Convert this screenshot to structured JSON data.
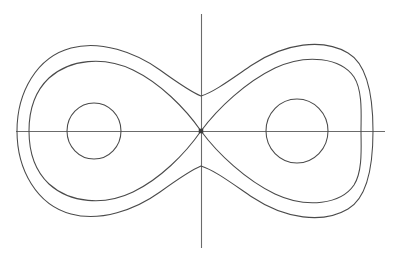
{
  "figure": {
    "title": "",
    "caption": "",
    "background_color": "#ffffff",
    "width": 399,
    "height": 259
  },
  "axes": {
    "stroke_color": "#6b6b6b",
    "x_axis": {
      "name": "horizontal-axis",
      "label": "",
      "y_pixel": 131,
      "x_start": 16,
      "x_end": 385
    },
    "y_axis": {
      "name": "vertical-axis",
      "label": "",
      "x_pixel": 201,
      "y_start": 14,
      "y_end": 248
    },
    "origin": {
      "x": 201,
      "y": 131
    }
  },
  "chart_data": {
    "type": "line",
    "title": "",
    "subtitle": "",
    "xlabel": "",
    "ylabel": "",
    "grid": false,
    "legend": "none",
    "xlim": [
      16,
      385
    ],
    "ylim": [
      14,
      248
    ],
    "fixed_points": [
      {
        "name": "saddle-origin",
        "type": "saddle",
        "x": 201,
        "y": 131
      },
      {
        "name": "center-left",
        "type": "center",
        "x": 94,
        "y": 131
      },
      {
        "name": "center-right",
        "type": "center",
        "x": 297,
        "y": 131
      }
    ],
    "series": [
      {
        "name": "small-orbit-left",
        "curve_type": "closed-circle",
        "center": [
          94,
          131
        ],
        "radius_x": 27,
        "radius_y": 28,
        "stroke": "#4a4a4a"
      },
      {
        "name": "small-orbit-right",
        "curve_type": "closed-circle",
        "center": [
          297,
          131
        ],
        "radius_x": 31,
        "radius_y": 32,
        "stroke": "#4a4a4a"
      },
      {
        "name": "separatrix-figure-eight",
        "curve_type": "figure-eight",
        "crossing_point": [
          201,
          131
        ],
        "left_extreme_x": 29,
        "right_extreme_x": 361,
        "top_y": 61,
        "bottom_y": 201,
        "stroke": "#4a4a4a"
      },
      {
        "name": "outer-orbit-enclosing-both-wells",
        "curve_type": "peanut-closed",
        "left_extreme_x": 17,
        "right_extreme_x": 373,
        "top_y": 45,
        "bottom_y": 217,
        "waist_top_y": 96,
        "waist_bottom_y": 166,
        "stroke": "#4a4a4a"
      }
    ]
  }
}
